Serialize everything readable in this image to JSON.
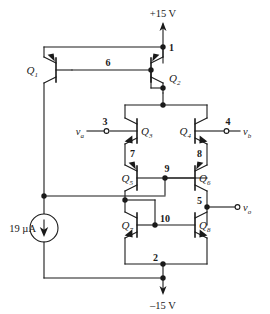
{
  "diagram": {
    "type": "schematic",
    "colors": {
      "wire": "#1a1a1a",
      "text": "#1a1a1a",
      "background": "#ffffff"
    }
  },
  "rails": {
    "positive": "+15 V",
    "negative": "–15 V"
  },
  "source": {
    "label": "19 µA",
    "kind": "current-source",
    "direction": "down"
  },
  "terminals": [
    {
      "id": "va",
      "symbol": "v",
      "subscript": "a",
      "node": "3",
      "side": "left"
    },
    {
      "id": "vb",
      "symbol": "v",
      "subscript": "b",
      "node": "4",
      "side": "right"
    },
    {
      "id": "vo",
      "symbol": "v",
      "subscript": "o",
      "node": "5",
      "side": "right"
    }
  ],
  "transistors": [
    {
      "id": "Q1",
      "symbol": "Q",
      "subscript": "1",
      "type": "pnp"
    },
    {
      "id": "Q2",
      "symbol": "Q",
      "subscript": "2",
      "type": "pnp"
    },
    {
      "id": "Q3",
      "symbol": "Q",
      "subscript": "3",
      "type": "npn"
    },
    {
      "id": "Q4",
      "symbol": "Q",
      "subscript": "4",
      "type": "npn"
    },
    {
      "id": "Q5",
      "symbol": "Q",
      "subscript": "5",
      "type": "pnp"
    },
    {
      "id": "Q6",
      "symbol": "Q",
      "subscript": "6",
      "type": "pnp"
    },
    {
      "id": "Q7",
      "symbol": "Q",
      "subscript": "7",
      "type": "npn"
    },
    {
      "id": "Q8",
      "symbol": "Q",
      "subscript": "8",
      "type": "npn"
    }
  ],
  "nodes": [
    {
      "id": "n1",
      "label": "1"
    },
    {
      "id": "n2",
      "label": "2"
    },
    {
      "id": "n3",
      "label": "3"
    },
    {
      "id": "n4",
      "label": "4"
    },
    {
      "id": "n5",
      "label": "5"
    },
    {
      "id": "n6",
      "label": "6"
    },
    {
      "id": "n7",
      "label": "7"
    },
    {
      "id": "n8",
      "label": "8"
    },
    {
      "id": "n9",
      "label": "9"
    },
    {
      "id": "n10",
      "label": "10"
    }
  ]
}
